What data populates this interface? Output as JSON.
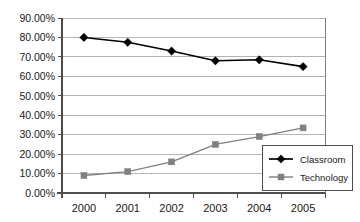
{
  "chart_data": {
    "type": "line",
    "title": "",
    "xlabel": "",
    "ylabel": "",
    "categories": [
      "2000",
      "2001",
      "2002",
      "2003",
      "2004",
      "2005"
    ],
    "series": [
      {
        "name": "Classroom",
        "marker": "diamond",
        "color": "#000000",
        "values": [
          80.0,
          77.5,
          73.0,
          68.0,
          68.5,
          65.0
        ]
      },
      {
        "name": "Technology",
        "marker": "square",
        "color": "#808080",
        "values": [
          9.0,
          11.0,
          16.0,
          25.0,
          29.0,
          33.5
        ]
      }
    ],
    "ylim": [
      0,
      90
    ],
    "ytick_step": 10,
    "ytick_labels": [
      "0.00%",
      "10.00%",
      "20.00%",
      "30.00%",
      "40.00%",
      "50.00%",
      "60.00%",
      "70.00%",
      "80.00%",
      "90.00%"
    ],
    "xtick_labels": [
      "2000",
      "2001",
      "2002",
      "2003",
      "2004",
      "2005"
    ],
    "grid": true,
    "grid_axis": "y",
    "legend_position": "bottom-right",
    "legend_entries": [
      "Classroom",
      "Technology"
    ],
    "colors": {
      "classroom": "#000000",
      "technology": "#808080",
      "gridline": "#b3b3b3",
      "axis": "#4d4d4d",
      "plot_border": "#808080",
      "background": "#ffffff",
      "text": "#1a1a1a"
    }
  }
}
